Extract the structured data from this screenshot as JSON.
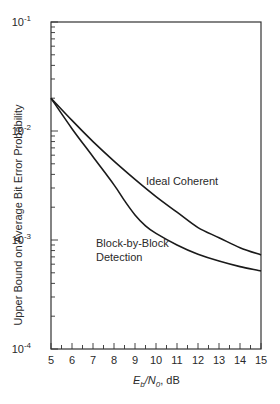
{
  "chart_data": {
    "type": "line",
    "title": "",
    "xlabel": "E_b/N_0, dB",
    "xlabel_parts": {
      "E": "E",
      "b": "b",
      "slash": "/N",
      "zero": "0",
      "unit": ", dB"
    },
    "ylabel": "Upper Bound on Average Bit Error Probability",
    "xlim": [
      5,
      15
    ],
    "ylim": [
      0.0001,
      0.1
    ],
    "yscale": "log",
    "grid": false,
    "x_ticks": [
      5,
      6,
      7,
      8,
      9,
      10,
      11,
      12,
      13,
      14,
      15
    ],
    "y_ticks": [
      {
        "value": 0.1,
        "base": "10",
        "exp": "-1"
      },
      {
        "value": 0.01,
        "base": "10",
        "exp": "-2"
      },
      {
        "value": 0.001,
        "base": "10",
        "exp": "-3"
      },
      {
        "value": 0.0001,
        "base": "10",
        "exp": "-4"
      }
    ],
    "series": [
      {
        "name": "Ideal Coherent",
        "x": [
          5,
          6,
          7,
          8,
          9,
          10,
          11,
          12,
          13,
          14,
          15
        ],
        "values": [
          0.02,
          0.0125,
          0.008,
          0.0053,
          0.0036,
          0.0025,
          0.0018,
          0.0013,
          0.00105,
          0.00085,
          0.00073
        ]
      },
      {
        "name": "Block-by-Block Detection",
        "x": [
          5,
          6,
          7,
          8,
          8.5,
          9,
          9.5,
          10,
          11,
          12,
          13,
          14,
          15
        ],
        "values": [
          0.02,
          0.0105,
          0.0058,
          0.0032,
          0.0023,
          0.0017,
          0.00135,
          0.00115,
          0.0009,
          0.00074,
          0.00064,
          0.00057,
          0.00052
        ]
      }
    ],
    "annotations": [
      {
        "text": "Ideal Coherent",
        "series": 0
      },
      {
        "text_line1": "Block-by-Block",
        "text_line2": "Detection",
        "series": 1
      }
    ],
    "legend": "none (inline labels)"
  }
}
